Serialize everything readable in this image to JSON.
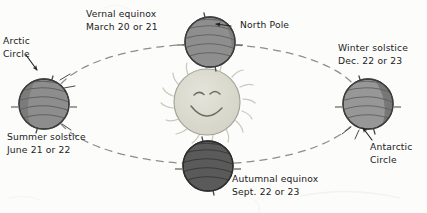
{
  "diagram": {
    "background_color": "#fcfcfb",
    "ink_color": "#222222",
    "orbit_color": "#8a8a8a"
  },
  "sun": {
    "name": "Sun",
    "fill_color": "#d9d9cf",
    "face": "smiling-face",
    "rays": 16
  },
  "labels": {
    "vernal": {
      "line1": "Vernal equinox",
      "line2": "March 20 or 21"
    },
    "north_pole": {
      "arrow": "←",
      "line1": "North Pole"
    },
    "winter": {
      "line1": "Winter solstice",
      "line2": "Dec. 22 or 23"
    },
    "arctic": {
      "line1": "Arctic",
      "line2": "Circle"
    },
    "summer": {
      "line1": "Summer solstice",
      "line2": "June 21 or 22"
    },
    "antarctic": {
      "line1": "Antarctic",
      "line2": "Circle"
    },
    "autumnal": {
      "line1": "Autumnal equinox",
      "line2": "Sept. 22 or 23"
    }
  },
  "earths": {
    "vernal": {
      "position": "top",
      "fill_color": "#8f8f8f",
      "season_label": "Vernal equinox"
    },
    "winter": {
      "position": "right",
      "fill_color": "#979797",
      "season_label": "Winter solstice"
    },
    "autumnal": {
      "position": "bottom",
      "fill_color": "#5a5a5a",
      "season_label": "Autumnal equinox"
    },
    "summer": {
      "position": "left",
      "fill_color": "#8d8d8d",
      "season_label": "Summer solstice"
    }
  }
}
